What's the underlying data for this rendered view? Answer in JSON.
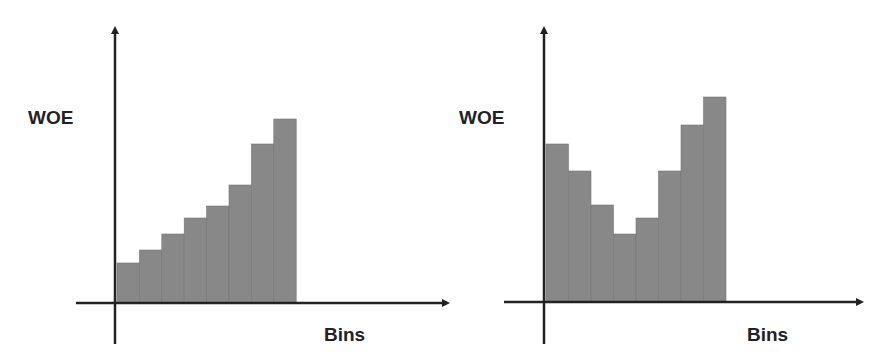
{
  "chart_data": [
    {
      "type": "bar",
      "title": "",
      "xlabel": "Bins",
      "ylabel": "WOE",
      "categories": [
        "1",
        "2",
        "3",
        "4",
        "5",
        "6",
        "7",
        "8"
      ],
      "values": [
        40,
        53,
        69,
        85,
        97,
        118,
        159,
        184
      ],
      "grid": false,
      "legend": null,
      "description": "Monotonically increasing WOE across bins"
    },
    {
      "type": "bar",
      "title": "",
      "xlabel": "Bins",
      "ylabel": "WOE",
      "categories": [
        "1",
        "2",
        "3",
        "4",
        "5",
        "6",
        "7",
        "8"
      ],
      "values": [
        158,
        131,
        97,
        68,
        84,
        131,
        177,
        205
      ],
      "grid": false,
      "legend": null,
      "description": "U-shaped (non-monotonic) WOE across bins"
    }
  ],
  "charts": [
    {
      "ylabel": "WOE",
      "xlabel": "Bins"
    },
    {
      "ylabel": "WOE",
      "xlabel": "Bins"
    }
  ],
  "colors": {
    "bar": "#888888",
    "axis": "#222222",
    "text": "#222222"
  }
}
